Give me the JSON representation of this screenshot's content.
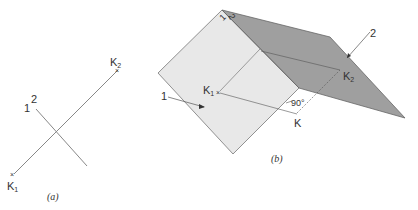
{
  "figure_a": {
    "caption": "(a)",
    "labels": {
      "k1": "K",
      "k1_sub": "1",
      "k2": "K",
      "k2_sub": "2",
      "line1": "1",
      "line2": "2"
    }
  },
  "figure_b": {
    "caption": "(b)",
    "labels": {
      "k1": "K",
      "k1_sub": "1",
      "k2": "K",
      "k2_sub": "2",
      "k": "K",
      "angle": "90°",
      "plane1": "1",
      "plane2": "2",
      "edge1": "1",
      "edge2": "2"
    }
  },
  "colors": {
    "plane_light": "#e6e6e6",
    "plane_dark": "#9a9a9a",
    "line": "#555555",
    "text": "#333333"
  }
}
